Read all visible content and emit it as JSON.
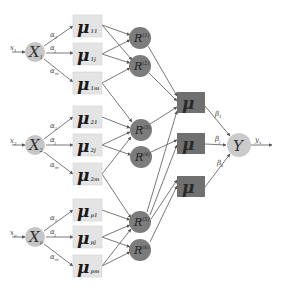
{
  "diagram": {
    "type": "neuro-fuzzy network",
    "colors": {
      "input_node": "#c6c6c6",
      "membership_box": "#e4e4e4",
      "rule_node": "#7c7c7c",
      "aggregate_box": "#707070",
      "output_node": "#cbcbcb",
      "edge": "#6a6a6a"
    },
    "inputs": [
      {
        "signal": "x",
        "signal_sub": "1",
        "node": "X",
        "node_sub": "1",
        "weights": [
          {
            "sym": "α",
            "sub": "1"
          },
          {
            "sym": "α",
            "sub": "j"
          },
          {
            "sym": "α",
            "sub": "m"
          }
        ],
        "memberships": [
          {
            "sym": "μ",
            "sub": "11"
          },
          {
            "sym": "μ",
            "sub": "1j"
          },
          {
            "sym": "μ",
            "sub": "1m"
          }
        ]
      },
      {
        "signal": "x",
        "signal_sub": "2",
        "node": "X",
        "node_sub": "2",
        "weights": [
          {
            "sym": "α",
            "sub": "1"
          },
          {
            "sym": "α",
            "sub": "j"
          },
          {
            "sym": "α",
            "sub": "m"
          }
        ],
        "memberships": [
          {
            "sym": "μ",
            "sub": "21"
          },
          {
            "sym": "μ",
            "sub": "2j"
          },
          {
            "sym": "μ",
            "sub": "2m"
          }
        ]
      },
      {
        "signal": "x",
        "signal_sub": "p",
        "node": "X",
        "node_sub": "p",
        "weights": [
          {
            "sym": "α",
            "sub": "1"
          },
          {
            "sym": "α",
            "sub": "j"
          },
          {
            "sym": "α",
            "sub": "m"
          }
        ],
        "memberships": [
          {
            "sym": "μ",
            "sub": "p1"
          },
          {
            "sym": "μ",
            "sub": "pj"
          },
          {
            "sym": "μ",
            "sub": "pm"
          }
        ]
      }
    ],
    "rules": [
      {
        "sym": "R",
        "sup": "(1)"
      },
      {
        "sym": "R",
        "sup": "(2)"
      },
      {
        "sym": "R",
        "sup": "(3)"
      },
      {
        "sym": "R",
        "sup": "(4)"
      },
      {
        "sym": "R",
        "sup": "(5)"
      },
      {
        "sym": "R",
        "sup": "(6)"
      }
    ],
    "aggregates": [
      {
        "sym": "μ"
      },
      {
        "sym": "μ"
      },
      {
        "sym": "μ"
      }
    ],
    "output_weights": [
      {
        "sym": "β",
        "sub": "1"
      },
      {
        "sym": "β",
        "sub": "j"
      },
      {
        "sym": "β",
        "sub": "k"
      }
    ],
    "output": {
      "node": "Y",
      "signal": "y",
      "signal_sub": "x"
    }
  }
}
